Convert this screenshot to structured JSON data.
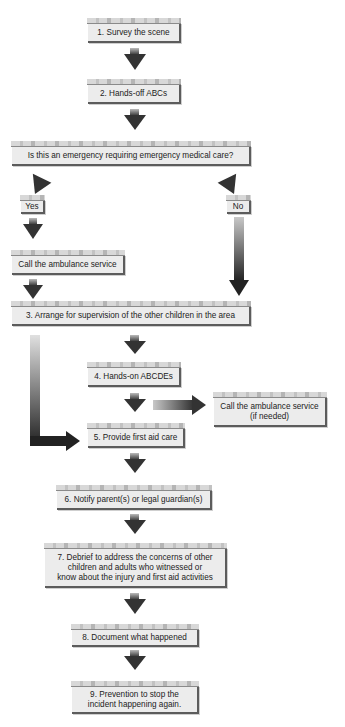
{
  "flowchart": {
    "steps": {
      "s1": "1. Survey the scene",
      "s2": "2. Hands-off ABCs",
      "q": "Is this an emergency requiring emergency medical care?",
      "yes": "Yes",
      "no": "No",
      "call1": "Call the ambulance service",
      "s3": "3. Arrange for supervision of the other children in the area",
      "s4": "4. Hands-on ABCDEs",
      "call2_l1": "Call the ambulance service",
      "call2_l2": "(if needed)",
      "s5": "5. Provide first aid care",
      "s6": "6. Notify parent(s) or legal guardian(s)",
      "s7_l1": "7. Debrief to address the concerns of other",
      "s7_l2": "children and adults who witnessed or",
      "s7_l3": "know about the injury and first aid activities",
      "s8": "8. Document what happened",
      "s9_l1": "9. Prevention to stop the",
      "s9_l2": "incident happening again."
    },
    "colors": {
      "box_fill": "#ececec",
      "box_shadow": "#5c5c5c",
      "arrow": "#333333"
    }
  }
}
